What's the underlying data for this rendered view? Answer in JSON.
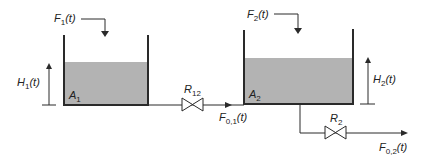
{
  "diagram": {
    "type": "two-tank system",
    "colors": {
      "fluid": "#b3b3b3",
      "line": "#2a2a2a"
    },
    "tank1": {
      "inflow": "F",
      "inflow_sub": "1",
      "inflow_arg": "(t)",
      "level": "H",
      "level_sub": "1",
      "level_arg": "(t)",
      "area": "A",
      "area_sub": "1"
    },
    "tank2": {
      "inflow": "F",
      "inflow_sub": "2",
      "inflow_arg": "(t)",
      "level": "H",
      "level_sub": "2",
      "level_arg": "(t)",
      "area": "A",
      "area_sub": "2"
    },
    "valve12": {
      "label": "R",
      "sub": "12"
    },
    "valve2": {
      "label": "R",
      "sub": "2"
    },
    "flow01": {
      "label": "F",
      "sub": "0,1",
      "arg": "(t)"
    },
    "flow02": {
      "label": "F",
      "sub": "0,2",
      "arg": "(t)"
    }
  }
}
